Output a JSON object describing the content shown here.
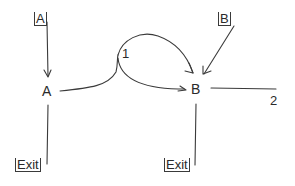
{
  "diagram": {
    "type": "state-transition",
    "nodes": [
      {
        "id": "A",
        "label": "A"
      },
      {
        "id": "B",
        "label": "B"
      }
    ],
    "entry_labels": [
      {
        "id": "entry-A",
        "label": "A",
        "target": "A"
      },
      {
        "id": "entry-B",
        "label": "B",
        "target": "B"
      }
    ],
    "exit_labels": [
      {
        "id": "exit-A",
        "label": "Exit",
        "source": "A"
      },
      {
        "id": "exit-B",
        "label": "Exit",
        "source": "B"
      }
    ],
    "junction_labels": [
      {
        "id": "junction-1",
        "label": "1"
      },
      {
        "id": "junction-2",
        "label": "2"
      }
    ],
    "edges": [
      {
        "from": "entry-A",
        "to": "A"
      },
      {
        "from": "entry-B",
        "to": "B"
      },
      {
        "from": "A",
        "to": "junction-1"
      },
      {
        "from": "junction-1",
        "to": "B",
        "note": "upper loop with arrow"
      },
      {
        "from": "junction-1",
        "to": "B",
        "note": "lower curve"
      },
      {
        "from": "B",
        "to": "junction-2"
      },
      {
        "from": "A",
        "to": "exit-A"
      },
      {
        "from": "B",
        "to": "exit-B"
      }
    ]
  }
}
